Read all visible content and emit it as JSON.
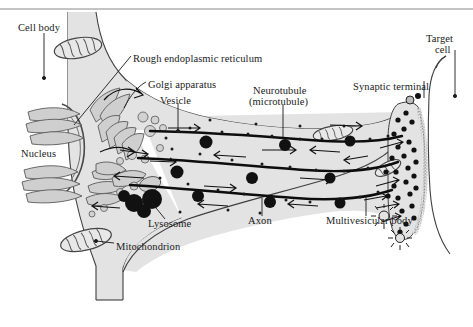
{
  "figure": {
    "background_color": "#ffffff",
    "cytoplasm_color": "#e3e3e3",
    "outline_color": "#3a3a3a",
    "label_color": "#1a1a1a",
    "top_rule_color": "#8a8a8a"
  },
  "labels": [
    {
      "id": "cell-body",
      "text": "Cell body",
      "x": 18,
      "y": 22,
      "align": "left"
    },
    {
      "id": "rough-er",
      "text": "Rough endoplasmic reticulum",
      "x": 133,
      "y": 59,
      "align": "left"
    },
    {
      "id": "golgi-apparatus",
      "text": "Golgi apparatus",
      "x": 148,
      "y": 85,
      "align": "left"
    },
    {
      "id": "vesicle",
      "text": "Vesicle",
      "x": 160,
      "y": 99,
      "align": "left"
    },
    {
      "id": "neurotubule",
      "text": "Neurotubule",
      "x": 253,
      "y": 89,
      "align": "left"
    },
    {
      "id": "microtubule",
      "text": "(microtubule)",
      "x": 249,
      "y": 100,
      "align": "left"
    },
    {
      "id": "synaptic-terminal",
      "text": "Synaptic terminal",
      "x": 355,
      "y": 85,
      "align": "left"
    },
    {
      "id": "target",
      "text": "Target",
      "x": 424,
      "y": 36,
      "align": "left"
    },
    {
      "id": "cell",
      "text": "cell",
      "x": 432,
      "y": 47,
      "align": "left"
    },
    {
      "id": "nucleus",
      "text": "Nucleus",
      "x": 21,
      "y": 153,
      "align": "left"
    },
    {
      "id": "lysosome",
      "text": "Lysosome",
      "x": 148,
      "y": 222,
      "align": "left"
    },
    {
      "id": "mitochondrion",
      "text": "Mitochondrion",
      "x": 116,
      "y": 245,
      "align": "left"
    },
    {
      "id": "axon",
      "text": "Axon",
      "x": 248,
      "y": 219,
      "align": "left"
    },
    {
      "id": "multivesicular-body",
      "text": "Multivesicular body",
      "x": 328,
      "y": 219,
      "align": "left"
    }
  ],
  "structures": {
    "cell_body": "soma with nucleus, rough ER stacks, Golgi apparatus, mitochondria, lysosomes",
    "axon": "elongated tapering process containing three neurotubules with bidirectional transport arrows",
    "synaptic_terminal": "bulbous ending with synaptic vesicles and active zone",
    "target_cell": "adjacent postsynaptic cell outline at right"
  },
  "transport": {
    "anterograde_direction": "toward synaptic terminal (right)",
    "retrograde_direction": "toward cell body (left)",
    "neurotubule_count": 3
  }
}
